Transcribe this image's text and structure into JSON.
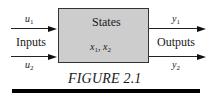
{
  "figure": {
    "caption": "FIGURE 2.1",
    "block": {
      "title": "States",
      "state_vars": [
        {
          "sym": "x",
          "sub": "1"
        },
        {
          "sym": "x",
          "sub": "2"
        }
      ],
      "separator": ", "
    },
    "inputs": {
      "label": "Inputs",
      "signals": [
        {
          "sym": "u",
          "sub": "1"
        },
        {
          "sym": "u",
          "sub": "2"
        }
      ]
    },
    "outputs": {
      "label": "Outputs",
      "signals": [
        {
          "sym": "y",
          "sub": "1"
        },
        {
          "sym": "y",
          "sub": "2"
        }
      ]
    }
  },
  "colors": {
    "block_fill": "#cdcdcd",
    "lines": "#222222",
    "bar": "#000000"
  }
}
